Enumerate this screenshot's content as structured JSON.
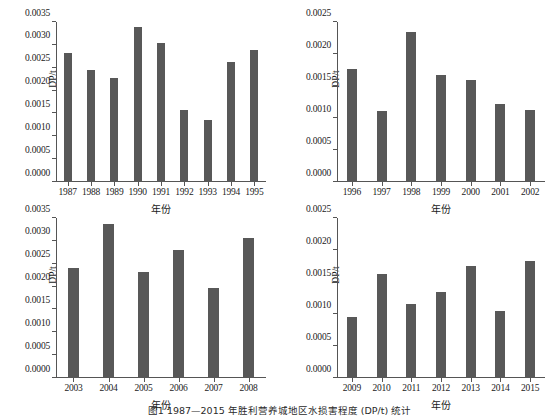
{
  "figure": {
    "caption": "图1  1987—2015 年胜利营养城地区水损害程度 (DP/t) 统计",
    "bar_color": "#585858",
    "axis_color": "#555555",
    "background": "#ffffff"
  },
  "chart_data": [
    {
      "type": "bar",
      "panel": "top-left",
      "title": "",
      "xlabel": "年份",
      "ylabel": "DP/t",
      "categories": [
        "1987",
        "1988",
        "1989",
        "1990",
        "1991",
        "1992",
        "1993",
        "1994",
        "1995"
      ],
      "values": [
        0.00282,
        0.00246,
        0.00227,
        0.00339,
        0.00305,
        0.00158,
        0.00135,
        0.00262,
        0.00288
      ],
      "ylim": [
        0,
        0.0035
      ],
      "yticks": [
        0.0,
        0.0005,
        0.001,
        0.0015,
        0.002,
        0.0025,
        0.003,
        0.0035
      ],
      "ytick_labels": [
        "0.0000",
        "0.0005",
        "0.0010",
        "0.0015",
        "0.0020",
        "0.0025",
        "0.0030",
        "0.0035"
      ],
      "grid": false,
      "legend": "none"
    },
    {
      "type": "bar",
      "panel": "top-right",
      "title": "",
      "xlabel": "年份",
      "ylabel": "DP/t",
      "categories": [
        "1996",
        "1997",
        "1998",
        "1999",
        "2000",
        "2001",
        "2002"
      ],
      "values": [
        0.00176,
        0.00111,
        0.00234,
        0.00167,
        0.0016,
        0.00122,
        0.00113
      ],
      "ylim": [
        0,
        0.0025
      ],
      "yticks": [
        0.0,
        0.0005,
        0.001,
        0.0015,
        0.002,
        0.0025
      ],
      "ytick_labels": [
        "0.0000",
        "0.0005",
        "0.0010",
        "0.0015",
        "0.0020",
        "0.0025"
      ],
      "grid": false,
      "legend": "none"
    },
    {
      "type": "bar",
      "panel": "bottom-left",
      "title": "",
      "xlabel": "年份",
      "ylabel": "DP/t",
      "categories": [
        "2003",
        "2004",
        "2005",
        "2006",
        "2007",
        "2008"
      ],
      "values": [
        0.00241,
        0.00338,
        0.00231,
        0.00279,
        0.00197,
        0.00307
      ],
      "ylim": [
        0,
        0.0035
      ],
      "yticks": [
        0.0,
        0.0005,
        0.001,
        0.0015,
        0.002,
        0.0025,
        0.003,
        0.0035
      ],
      "ytick_labels": [
        "0.0000",
        "0.0005",
        "0.0010",
        "0.0015",
        "0.0020",
        "0.0025",
        "0.0030",
        "0.0035"
      ],
      "grid": false,
      "legend": "none"
    },
    {
      "type": "bar",
      "panel": "bottom-right",
      "title": "",
      "xlabel": "年份",
      "ylabel": "DP/t",
      "categories": [
        "2009",
        "2010",
        "2011",
        "2012",
        "2013",
        "2014",
        "2015"
      ],
      "values": [
        0.00095,
        0.00163,
        0.00116,
        0.00135,
        0.00175,
        0.00104,
        0.00183
      ],
      "ylim": [
        0,
        0.0025
      ],
      "yticks": [
        0.0,
        0.0005,
        0.001,
        0.0015,
        0.002,
        0.0025
      ],
      "ytick_labels": [
        "0.0000",
        "0.0005",
        "0.0010",
        "0.0015",
        "0.0020",
        "0.0025"
      ],
      "grid": false,
      "legend": "none"
    }
  ]
}
